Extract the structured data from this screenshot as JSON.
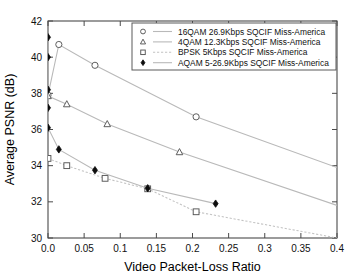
{
  "chart_data": {
    "type": "line",
    "title": "",
    "xlabel": "Video Packet-Loss Ratio",
    "ylabel": "Average PSNR (dB)",
    "xlim": [
      0.0,
      0.4
    ],
    "ylim": [
      30,
      42
    ],
    "xticks": [
      "0.0",
      "0.05",
      "0.1",
      "0.15",
      "0.2",
      "0.25",
      "0.3",
      "0.35",
      "0.4"
    ],
    "xtick_values": [
      0.0,
      0.05,
      0.1,
      0.15,
      0.2,
      0.25,
      0.3,
      0.35,
      0.4
    ],
    "yticks": [
      "30",
      "32",
      "34",
      "36",
      "38",
      "40",
      "42"
    ],
    "ytick_values": [
      30,
      32,
      34,
      36,
      38,
      40,
      42
    ],
    "grid": false,
    "legend_position": "top-right-inside",
    "series": [
      {
        "name": "16QAM 26.9Kbps SQCIF Miss-America",
        "marker": "open-circle",
        "linestyle": "solid",
        "points": [
          {
            "x": 0.0,
            "y": 37.9
          },
          {
            "x": 0.015,
            "y": 40.7
          },
          {
            "x": 0.065,
            "y": 39.55
          },
          {
            "x": 0.205,
            "y": 36.7
          },
          {
            "x": 0.4,
            "y": 33.9
          }
        ]
      },
      {
        "name": "4QAM 12.3Kbps SQCIF Miss-America",
        "marker": "open-triangle",
        "linestyle": "solid",
        "points": [
          {
            "x": 0.0,
            "y": 37.85
          },
          {
            "x": 0.026,
            "y": 37.4
          },
          {
            "x": 0.082,
            "y": 36.3
          },
          {
            "x": 0.182,
            "y": 34.75
          },
          {
            "x": 0.4,
            "y": 31.8
          }
        ]
      },
      {
        "name": "BPSK 5Kbps SQCIF Miss-America",
        "marker": "open-square",
        "linestyle": "dotted",
        "points": [
          {
            "x": 0.0,
            "y": 34.4
          },
          {
            "x": 0.026,
            "y": 34.0
          },
          {
            "x": 0.079,
            "y": 33.3
          },
          {
            "x": 0.138,
            "y": 32.72
          },
          {
            "x": 0.205,
            "y": 31.45
          },
          {
            "x": 0.4,
            "y": 30.0
          }
        ]
      },
      {
        "name": "AQAM 5-26.9Kbps SQCIF Miss-America",
        "marker": "filled-diamond",
        "linestyle": "solid",
        "points": [
          {
            "x": 0.0,
            "y": 41.1
          },
          {
            "x": 0.0,
            "y": 40.0
          },
          {
            "x": 0.0,
            "y": 38.2
          },
          {
            "x": 0.0,
            "y": 37.2
          },
          {
            "x": 0.0,
            "y": 36.1
          },
          {
            "x": 0.015,
            "y": 34.9
          },
          {
            "x": 0.065,
            "y": 33.75
          },
          {
            "x": 0.138,
            "y": 32.75
          },
          {
            "x": 0.232,
            "y": 31.9
          }
        ]
      }
    ]
  },
  "legend": {
    "entries": [
      {
        "label": "16QAM 26.9Kbps SQCIF Miss-America",
        "marker": "open-circle"
      },
      {
        "label": "4QAM 12.3Kbps SQCIF Miss-America",
        "marker": "open-triangle"
      },
      {
        "label": "BPSK 5Kbps SQCIF Miss-America",
        "marker": "open-square"
      },
      {
        "label": "AQAM 5-26.9Kbps SQCIF Miss-America",
        "marker": "filled-diamond"
      }
    ]
  },
  "colors": {
    "line": "#b9b9b9",
    "marker_open_stroke": "#555555",
    "marker_solid": "#0d0d0d",
    "frame": "#4a4a4a",
    "background": "#ffffff"
  }
}
